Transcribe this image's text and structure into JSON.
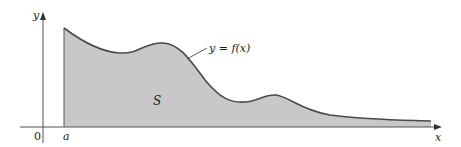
{
  "figure": {
    "axes": {
      "x_label": "x",
      "y_label": "y",
      "origin_label": "0"
    },
    "labels": {
      "lower_bound": "a",
      "region": "S",
      "curve": "y = f(x)"
    },
    "colors": {
      "background": "#ffffff",
      "region_fill": "#c8c8c8",
      "curve_stroke": "#4a4a4a",
      "axis_stroke": "#555555"
    }
  }
}
